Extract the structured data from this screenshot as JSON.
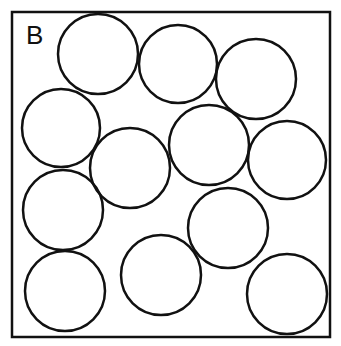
{
  "panel": {
    "label": "B",
    "box": {
      "x": 12,
      "y": 12,
      "width": 318,
      "height": 325
    },
    "stroke_color": "#111111"
  },
  "circles": [
    {
      "cx": 98,
      "cy": 54,
      "r": 40
    },
    {
      "cx": 178,
      "cy": 64,
      "r": 39
    },
    {
      "cx": 256,
      "cy": 79,
      "r": 40
    },
    {
      "cx": 61,
      "cy": 128,
      "r": 39
    },
    {
      "cx": 209,
      "cy": 145,
      "r": 40
    },
    {
      "cx": 130,
      "cy": 168,
      "r": 40
    },
    {
      "cx": 287,
      "cy": 160,
      "r": 39
    },
    {
      "cx": 63,
      "cy": 210,
      "r": 40
    },
    {
      "cx": 228,
      "cy": 228,
      "r": 40
    },
    {
      "cx": 161,
      "cy": 275,
      "r": 40
    },
    {
      "cx": 65,
      "cy": 291,
      "r": 40
    },
    {
      "cx": 287,
      "cy": 294,
      "r": 40
    }
  ]
}
